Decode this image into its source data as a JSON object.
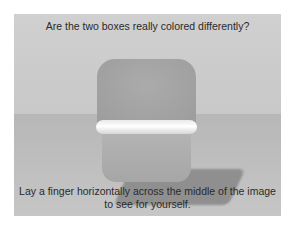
{
  "illusion": {
    "question": "Are the two boxes really colored differently?",
    "instruction": "Lay a finger horizontally across the middle of the image to see for yourself.",
    "colors": {
      "background": "#ffffff",
      "wall": "#cccccc",
      "floor": "#bcbcbc",
      "upper_box": "#a2a2a2",
      "lower_box": "#acacac",
      "ledge": "#f4f4f4",
      "shadow": "#8f8f8f"
    }
  }
}
